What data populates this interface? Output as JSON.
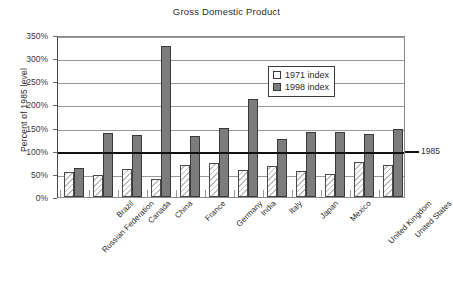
{
  "chart_data": {
    "type": "bar",
    "title": "Gross Domestic Product",
    "xlabel": "",
    "ylabel": "Percent of 1985 level",
    "ylim": [
      0,
      350
    ],
    "ytick_labels": [
      "0%",
      "50%",
      "100%",
      "150%",
      "200%",
      "250%",
      "300%",
      "350%"
    ],
    "ytick_values": [
      0,
      50,
      100,
      150,
      200,
      250,
      300,
      350
    ],
    "grid": true,
    "legend_position": "upper right",
    "categories": [
      "Russian Federation",
      "Brazil",
      "Canada",
      "China",
      "France",
      "Germany",
      "India",
      "Italy",
      "Japan",
      "Mexico",
      "United Kingdom",
      "United States"
    ],
    "series": [
      {
        "name": "1971 index",
        "color": "#ffffff",
        "values": [
          53,
          47,
          61,
          38,
          69,
          74,
          59,
          67,
          57,
          50,
          76,
          70
        ]
      },
      {
        "name": "1998 index",
        "color": "#7c7c7c",
        "values": [
          63,
          138,
          135,
          327,
          132,
          150,
          211,
          126,
          140,
          140,
          136,
          146
        ]
      }
    ],
    "reference_line": {
      "label": "1985",
      "value": 100,
      "color": "#111111"
    }
  }
}
